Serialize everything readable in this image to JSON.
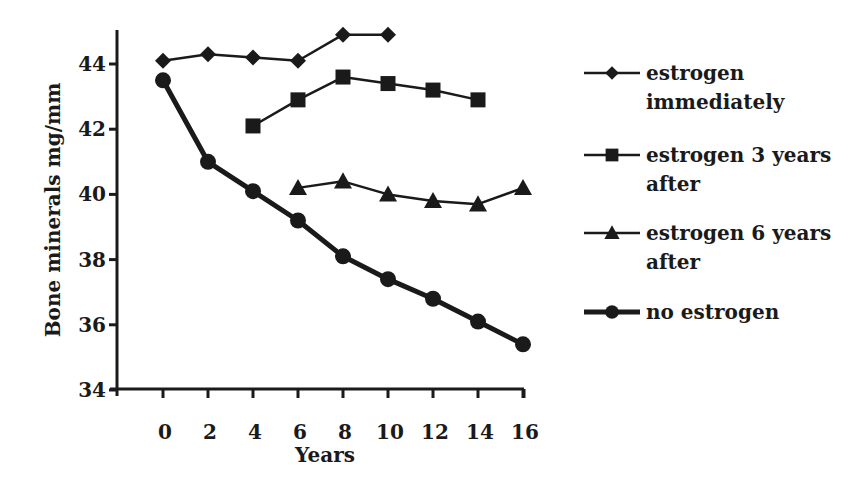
{
  "chart_data": {
    "type": "line",
    "title": "",
    "xlabel": "Years",
    "ylabel": "Bone minerals mg/mm",
    "x": [
      0,
      2,
      4,
      6,
      8,
      10,
      12,
      14,
      16
    ],
    "xticks": [
      "0",
      "2",
      "4",
      "6",
      "8",
      "10",
      "12",
      "14",
      "16"
    ],
    "yticks": [
      "34",
      "36",
      "38",
      "40",
      "42",
      "44"
    ],
    "ylim": [
      34,
      45
    ],
    "xlim": [
      -2,
      16
    ],
    "grid": false,
    "legend_position": "right",
    "series": [
      {
        "name": "estrogen immediately",
        "legend_lines": [
          "estrogen",
          "immediately"
        ],
        "marker": "diamond",
        "line_width": 2.5,
        "x": [
          0,
          2,
          4,
          6,
          8,
          10
        ],
        "values": [
          44.1,
          44.3,
          44.2,
          44.1,
          44.9,
          44.9
        ]
      },
      {
        "name": "estrogen 3 years after",
        "legend_lines": [
          "estrogen 3 years",
          "after"
        ],
        "marker": "square",
        "line_width": 2.5,
        "x": [
          4,
          6,
          8,
          10,
          12,
          14
        ],
        "values": [
          42.1,
          42.9,
          43.6,
          43.4,
          43.2,
          42.9
        ]
      },
      {
        "name": "estrogen 6 years after",
        "legend_lines": [
          "estrogen 6 years",
          "after"
        ],
        "marker": "triangle",
        "line_width": 2.5,
        "x": [
          6,
          8,
          10,
          12,
          14,
          16
        ],
        "values": [
          40.2,
          40.4,
          40.0,
          39.8,
          39.7,
          40.2
        ]
      },
      {
        "name": "no estrogen",
        "legend_lines": [
          "no estrogen"
        ],
        "marker": "circle",
        "line_width": 5,
        "x": [
          0,
          2,
          4,
          6,
          8,
          10,
          12,
          14,
          16
        ],
        "values": [
          43.5,
          41.0,
          40.1,
          39.2,
          38.1,
          37.4,
          36.8,
          36.1,
          35.4
        ]
      }
    ]
  },
  "colors": {
    "ink": "#1a1a1a",
    "background": "#ffffff"
  }
}
